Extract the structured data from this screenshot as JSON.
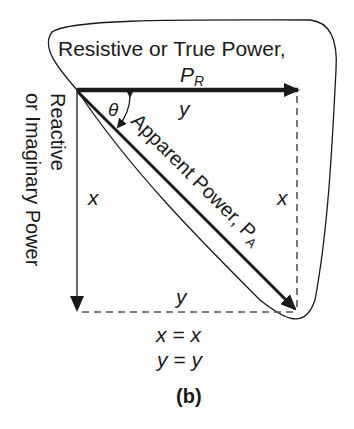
{
  "diagram": {
    "title_label": "Resistive or  True Power,",
    "resistive_symbol": "P",
    "resistive_subscript": "R",
    "top_side_label": "y",
    "angle_label": "θ",
    "hypotenuse_label": "Apparent Power, P",
    "hypotenuse_subscript": "A",
    "reactive_label_line1": "Reactive",
    "reactive_label_line2": "or Imaginary Power",
    "left_side_label": "x",
    "right_side_label": "x",
    "bottom_side_label": "y",
    "equation_1": "x = x",
    "equation_2": "y = y",
    "caption": "(b)",
    "colors": {
      "stroke": "#1a1a1a",
      "dashed": "#555555",
      "background": "#ffffff"
    }
  }
}
